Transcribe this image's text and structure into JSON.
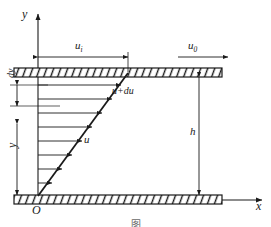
{
  "figure": {
    "caption": "图",
    "colors": {
      "line": "#1a1a1a",
      "background": "#ffffff",
      "arrow": "#333333",
      "caption": "#6a6a6a"
    },
    "axes": {
      "y_label": "y",
      "x_label": "x",
      "origin_label": "O"
    },
    "labels": {
      "u_i": "u",
      "u_i_sub": "i",
      "u_0": "u",
      "u_0_sub": "0",
      "u": "u",
      "u_plus_du": "u+du",
      "dy": "dy",
      "y": "y",
      "h": "h"
    },
    "plates": {
      "top_label": "moving-plate",
      "bottom_label": "stationary-plate",
      "hatch_count": 26
    },
    "velocity_arrows": 8
  }
}
